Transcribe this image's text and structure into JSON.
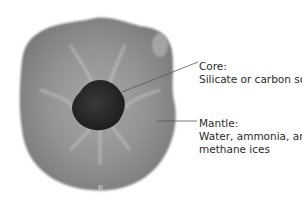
{
  "diagram": {
    "colors": {
      "background": "#ffffff",
      "mantle": "#8c8c8c",
      "mantle_light": "#b0b0b0",
      "core": "#262626",
      "leader_line": "#555555",
      "text": "#2a2a2a"
    },
    "labels": {
      "core": {
        "title": "Core:",
        "lines": [
          "Silicate or carbon soot"
        ]
      },
      "mantle": {
        "title": "Mantle:",
        "lines": [
          "Water, ammonia, and",
          "methane ices"
        ]
      }
    }
  }
}
